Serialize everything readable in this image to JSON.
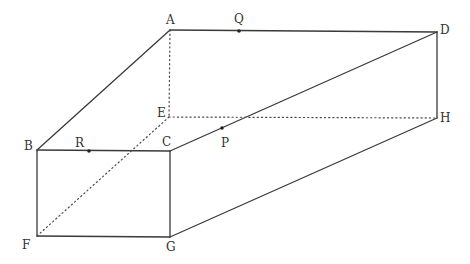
{
  "vertices": {
    "A": {
      "label": "A",
      "x": 170,
      "y": 30,
      "lx": 166,
      "ly": 24
    },
    "B": {
      "label": "B",
      "x": 37,
      "y": 150,
      "lx": 24,
      "ly": 154
    },
    "C": {
      "label": "C",
      "x": 170,
      "y": 151,
      "lx": 162,
      "ly": 146
    },
    "D": {
      "label": "D",
      "x": 437,
      "y": 32,
      "lx": 440,
      "ly": 34
    },
    "E": {
      "label": "E",
      "x": 169,
      "y": 117,
      "lx": 157,
      "ly": 116
    },
    "F": {
      "label": "F",
      "x": 37,
      "y": 236,
      "lx": 22,
      "ly": 248
    },
    "G": {
      "label": "G",
      "x": 170,
      "y": 237,
      "lx": 167,
      "ly": 251
    },
    "H": {
      "label": "H",
      "x": 437,
      "y": 118,
      "lx": 440,
      "ly": 122
    }
  },
  "points": {
    "P": {
      "label": "P",
      "x": 222,
      "y": 128,
      "lx": 221,
      "ly": 147
    },
    "Q": {
      "label": "Q",
      "x": 239,
      "y": 31,
      "lx": 236,
      "ly": 23
    },
    "R": {
      "label": "R",
      "x": 89,
      "y": 151,
      "lx": 75,
      "ly": 147
    }
  },
  "edges": {
    "solid": [
      "A-D",
      "A-B",
      "B-C",
      "C-D",
      "B-F",
      "F-G",
      "C-G",
      "G-H",
      "D-H"
    ],
    "dotted": [
      "A-E",
      "E-H",
      "E-F"
    ]
  }
}
